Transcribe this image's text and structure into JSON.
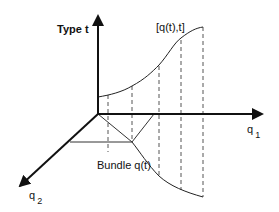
{
  "diagram": {
    "labels": {
      "vertical_axis": "Type t",
      "upper_curve": "[q(t),t]",
      "q1_axis_base": "q",
      "q1_axis_sub": "1",
      "q2_axis_base": "q",
      "q2_axis_sub": "2",
      "lower_curve": "Bundle q(t)"
    },
    "colors": {
      "line": "#111111",
      "dashed": "#555555",
      "background": "#ffffff"
    }
  }
}
